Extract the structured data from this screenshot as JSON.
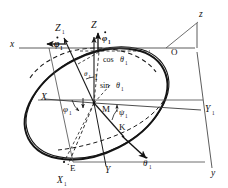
{
  "figure": {
    "type": "technical-line-diagram",
    "background_color": "#ffffff",
    "line_color": "#1a1a1a",
    "thin_line_color": "#555555",
    "width": 228,
    "height": 188
  },
  "axes": {
    "fixed": [
      {
        "key": "x",
        "label": "x",
        "x": 10,
        "y": 47,
        "size": 9.5,
        "style": "italic"
      },
      {
        "key": "z",
        "label": "z",
        "x": 199,
        "y": 17,
        "size": 9.5,
        "style": "italic"
      },
      {
        "key": "y",
        "label": "y",
        "x": 211,
        "y": 176,
        "size": 9.5,
        "style": "italic"
      }
    ],
    "body": [
      {
        "key": "X",
        "label": "X",
        "x": 41,
        "y": 100,
        "size": 9.5,
        "style": "italic"
      },
      {
        "key": "Y",
        "label": "Y",
        "x": 105,
        "y": 173,
        "size": 9.5,
        "style": "italic"
      },
      {
        "key": "Z",
        "label": "Z",
        "x": 91,
        "y": 28,
        "size": 10,
        "style": "italic"
      }
    ],
    "intermediate": [
      {
        "key": "X1",
        "label": "X",
        "sub": "1",
        "x": 57,
        "y": 183,
        "size": 9.5
      },
      {
        "key": "Y1",
        "label": "Y",
        "sub": "1",
        "x": 205,
        "y": 112,
        "size": 9.5
      },
      {
        "key": "Z1",
        "label": "Z",
        "sub": "1",
        "x": 55,
        "y": 31,
        "size": 10
      }
    ]
  },
  "points": [
    {
      "key": "O",
      "label": "O",
      "x": 171,
      "y": 55,
      "size": 9
    },
    {
      "key": "M",
      "label": "M",
      "x": 102,
      "y": 112,
      "size": 9
    },
    {
      "key": "K",
      "label": "K",
      "x": 119,
      "y": 130,
      "size": 9
    },
    {
      "key": "E",
      "label": "E",
      "x": 70,
      "y": 171,
      "size": 9
    }
  ],
  "angles": [
    {
      "key": "phi1-base",
      "label": "φ",
      "sub": "1",
      "x": 63,
      "y": 112,
      "size": 9,
      "bold": false,
      "dot": false
    },
    {
      "key": "theta1-top",
      "label": "θ",
      "sub": "1",
      "x": 84,
      "y": 76,
      "size": 7,
      "bold": false,
      "dot": false
    },
    {
      "key": "psi1",
      "label": "ψ",
      "sub": "1",
      "x": 119,
      "y": 115,
      "size": 8.5,
      "bold": false,
      "dot": false
    }
  ],
  "rates": [
    {
      "key": "phi1-dot-left",
      "label": "φ",
      "sub": "1",
      "x": 54,
      "y": 47,
      "size": 9.5,
      "bold": true,
      "dot": true
    },
    {
      "key": "phi1-dot-top",
      "label": "φ",
      "sub": "1",
      "x": 102,
      "y": 41,
      "size": 9,
      "bold": true,
      "dot": true
    },
    {
      "key": "theta1-dot",
      "label": "θ",
      "sub": "1",
      "x": 143,
      "y": 166,
      "size": 9,
      "bold": false,
      "dot": true
    }
  ],
  "projections": [
    {
      "key": "cos-theta1",
      "text": "cos",
      "symbol": "θ",
      "sub": "1",
      "x": 103,
      "y": 62,
      "size": 8
    },
    {
      "key": "unit-one",
      "text": "1",
      "symbol": "",
      "sub": "",
      "x": 94,
      "y": 80,
      "size": 8
    },
    {
      "key": "sin-theta1",
      "text": "sin",
      "symbol": "θ",
      "sub": "1",
      "x": 100,
      "y": 88,
      "size": 8
    }
  ],
  "geometry": {
    "origin_M": {
      "x": 94,
      "y": 103
    },
    "point_O": {
      "x": 166,
      "y": 48
    },
    "ellipse_center": {
      "x": 96,
      "y": 104
    },
    "ellipse_rx": 76,
    "ellipse_ry": 49,
    "ellipse_rotation_deg": -27
  }
}
